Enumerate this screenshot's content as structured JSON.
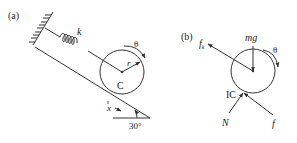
{
  "panel_a": {
    "label": "(a)",
    "spring_label": "k",
    "rotation_label": "θ",
    "radius_label": "r",
    "center_label": "C",
    "displacement_label": "x",
    "angle_label": "30°"
  },
  "panel_b": {
    "label": "(b)",
    "friction_spring_force_label": "f",
    "friction_spring_sub": "k",
    "weight_label": "mg",
    "rotation_label": "θ",
    "instant_center_label": "IC",
    "normal_label": "N",
    "friction_label": "f"
  },
  "colors": {
    "line": "#333333",
    "background": "#ffffff"
  }
}
